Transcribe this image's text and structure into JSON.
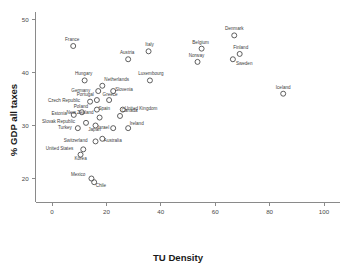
{
  "chart_data": {
    "type": "scatter",
    "title": "",
    "xlabel": "TU Density",
    "ylabel": "% GDP all taxes",
    "xlim": [
      -6,
      106
    ],
    "ylim": [
      15.5,
      51.5
    ],
    "xticks": [
      0,
      20,
      40,
      60,
      80,
      100
    ],
    "yticks": [
      20,
      30,
      40,
      50
    ],
    "grid": false,
    "legend": "none",
    "points": [
      {
        "label": "France",
        "x": 7.8,
        "y": 45.0,
        "lx": -1,
        "ly": -5
      },
      {
        "label": "Italy",
        "x": 35.5,
        "y": 44.0,
        "lx": 1,
        "ly": -5
      },
      {
        "label": "Denmark",
        "x": 67.0,
        "y": 47.0,
        "lx": 0,
        "ly": -5
      },
      {
        "label": "Austria",
        "x": 28.0,
        "y": 42.5,
        "lx": -1,
        "ly": -5
      },
      {
        "label": "Belgium",
        "x": 55.0,
        "y": 44.5,
        "lx": -1,
        "ly": -5
      },
      {
        "label": "Finland",
        "x": 69.0,
        "y": 43.5,
        "lx": 1,
        "ly": -5
      },
      {
        "label": "Sweden",
        "x": 66.5,
        "y": 42.5,
        "lx": 3,
        "ly": 6
      },
      {
        "label": "Norway",
        "x": 53.5,
        "y": 42.0,
        "lx": -1,
        "ly": -5
      },
      {
        "label": "Hungary",
        "x": 12.0,
        "y": 38.5,
        "lx": -1,
        "ly": -5
      },
      {
        "label": "Luxembourg",
        "x": 36.0,
        "y": 38.5,
        "lx": 1,
        "ly": -5
      },
      {
        "label": "Netherlands",
        "x": 18.5,
        "y": 37.5,
        "lx": 2,
        "ly": -5
      },
      {
        "label": "Germany",
        "x": 17.0,
        "y": 36.5,
        "lx": -8,
        "ly": 0.5
      },
      {
        "label": "Slovenia",
        "x": 22.5,
        "y": 36.5,
        "lx": 2,
        "ly": -0.5
      },
      {
        "label": "Iceland",
        "x": 85.0,
        "y": 36.0,
        "lx": 0,
        "ly": -5
      },
      {
        "label": "Portugal",
        "x": 16.5,
        "y": 34.8,
        "lx": -3,
        "ly": -4
      },
      {
        "label": "Greece",
        "x": 21.0,
        "y": 34.8,
        "lx": 1,
        "ly": -4
      },
      {
        "label": "Czech Republic",
        "x": 14.0,
        "y": 34.5,
        "lx": -10,
        "ly": 0.5
      },
      {
        "label": "United Kingdom",
        "x": 26.0,
        "y": 33.0,
        "lx": 2,
        "ly": 0.5
      },
      {
        "label": "Spain",
        "x": 16.5,
        "y": 33.0,
        "lx": 1.5,
        "ly": 0.5
      },
      {
        "label": "Poland",
        "x": 11.0,
        "y": 32.5,
        "lx": -1,
        "ly": -4
      },
      {
        "label": "Estonia",
        "x": 8.0,
        "y": 32.0,
        "lx": -7,
        "ly": 0.5
      },
      {
        "label": "New Zealand",
        "x": 17.5,
        "y": 31.5,
        "lx": -6,
        "ly": -3.5
      },
      {
        "label": "Canada",
        "x": 25.0,
        "y": 31.8,
        "lx": 1.5,
        "ly": -3.5
      },
      {
        "label": "Slovak Republic",
        "x": 12.5,
        "y": 30.5,
        "lx": -11,
        "ly": 0.5
      },
      {
        "label": "Japan",
        "x": 16.0,
        "y": 30.0,
        "lx": -1,
        "ly": 5
      },
      {
        "label": "Ireland",
        "x": 28.0,
        "y": 29.5,
        "lx": 1.5,
        "ly": -3.5
      },
      {
        "label": "Turkey",
        "x": 9.5,
        "y": 29.5,
        "lx": -6,
        "ly": 0.5
      },
      {
        "label": "Israel",
        "x": 22.5,
        "y": 29.5,
        "lx": -4,
        "ly": 0.5
      },
      {
        "label": "Australia",
        "x": 18.5,
        "y": 27.5,
        "lx": 1.5,
        "ly": 3.5
      },
      {
        "label": "Switzerland",
        "x": 16.0,
        "y": 27.0,
        "lx": -8,
        "ly": 0.5
      },
      {
        "label": "United States",
        "x": 11.5,
        "y": 25.5,
        "lx": -10,
        "ly": 0.5
      },
      {
        "label": "Korea",
        "x": 10.5,
        "y": 24.5,
        "lx": 0,
        "ly": 5
      },
      {
        "label": "Mexico",
        "x": 14.5,
        "y": 20.0,
        "lx": -6,
        "ly": -2.5
      },
      {
        "label": "Chile",
        "x": 15.5,
        "y": 19.3,
        "lx": 1.5,
        "ly": 4.5
      }
    ]
  }
}
